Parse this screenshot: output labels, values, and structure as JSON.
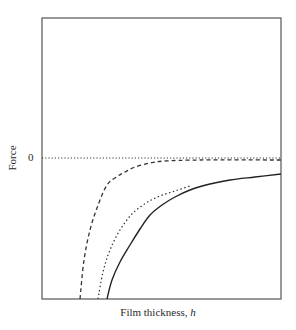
{
  "chart_data": {
    "type": "line",
    "title": "",
    "xlabel": "Film thickness, h",
    "xlabel_text": "Film thickness, ",
    "xlabel_var": "h",
    "ylabel": "Force",
    "yticks": [
      "0"
    ],
    "grid": false,
    "legend": null,
    "plot_area_px": {
      "left": 42,
      "top": 18,
      "right": 281,
      "bottom": 299
    },
    "zero_line_y_px": 158,
    "series": [
      {
        "name": "zero-reference",
        "style": "dotted",
        "points_px": [
          [
            42,
            158
          ],
          [
            281,
            158
          ]
        ]
      },
      {
        "name": "dashed-curve",
        "style": "dashed",
        "description": "Steep attractive force at small h, decays rapidly to ~0",
        "points_px": [
          [
            80,
            299
          ],
          [
            84,
            260
          ],
          [
            90,
            230
          ],
          [
            97,
            208
          ],
          [
            107,
            185
          ],
          [
            118,
            176
          ],
          [
            125,
            172
          ],
          [
            135,
            167
          ],
          [
            150,
            163
          ],
          [
            165,
            161
          ],
          [
            200,
            160
          ],
          [
            281,
            160
          ]
        ]
      },
      {
        "name": "dotted-curve",
        "style": "dotted",
        "description": "Nearly overlaps solid curve, slightly to the left at small h",
        "points_px": [
          [
            98,
            299
          ],
          [
            103,
            272
          ],
          [
            110,
            250
          ],
          [
            120,
            230
          ],
          [
            132,
            214
          ],
          [
            146,
            203
          ],
          [
            160,
            196
          ],
          [
            175,
            191
          ],
          [
            190,
            186
          ]
        ]
      },
      {
        "name": "solid-curve",
        "style": "solid",
        "description": "Long-range attractive force decaying slowly toward zero",
        "points_px": [
          [
            107,
            299
          ],
          [
            112,
            280
          ],
          [
            120,
            262
          ],
          [
            130,
            245
          ],
          [
            140,
            229
          ],
          [
            150,
            215
          ],
          [
            162,
            205
          ],
          [
            175,
            197
          ],
          [
            190,
            190
          ],
          [
            210,
            184
          ],
          [
            230,
            180
          ],
          [
            255,
            177
          ],
          [
            281,
            174
          ]
        ]
      }
    ]
  }
}
